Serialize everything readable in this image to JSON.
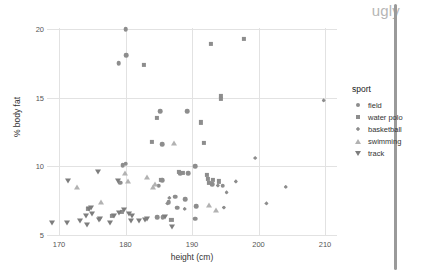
{
  "watermark": "ugly",
  "legend": {
    "title": "sport",
    "entries": [
      {
        "label": "field",
        "marker": "circle-marker-icon"
      },
      {
        "label": "water polo",
        "marker": "square-marker-icon"
      },
      {
        "label": "basketball",
        "marker": "diamond-marker-icon"
      },
      {
        "label": "swimming",
        "marker": "triangle-up-marker-icon"
      },
      {
        "label": "track",
        "marker": "triangle-down-marker-icon"
      }
    ]
  },
  "chart_data": {
    "type": "scatter",
    "title": "",
    "xlabel": "height (cm)",
    "ylabel": "% body fat",
    "xlim": [
      166.5,
      212.5
    ],
    "ylim": [
      4.6,
      20.6
    ],
    "xticks": [
      170,
      180,
      190,
      200,
      210
    ],
    "yticks": [
      5,
      10,
      15,
      20
    ],
    "grid": true,
    "legend_position": "right",
    "legend_title": "sport",
    "series": [
      {
        "name": "field",
        "marker": "circle",
        "color": "#8d8d8d",
        "points": [
          [
            180.0,
            20.0
          ],
          [
            180.1,
            18.1
          ],
          [
            179.0,
            17.5
          ],
          [
            185.2,
            14.0
          ],
          [
            189.3,
            14.0
          ],
          [
            185.5,
            11.6
          ],
          [
            179.6,
            10.1
          ],
          [
            180.0,
            10.2
          ],
          [
            179.2,
            8.8
          ],
          [
            185.0,
            8.6
          ],
          [
            185.5,
            9.0
          ],
          [
            188.2,
            9.5
          ],
          [
            189.4,
            9.5
          ],
          [
            190.5,
            10.0
          ],
          [
            187.5,
            7.8
          ],
          [
            189.0,
            7.6
          ],
          [
            186.5,
            7.4
          ],
          [
            187.8,
            7.0
          ],
          [
            190.6,
            7.1
          ],
          [
            193.0,
            8.7
          ],
          [
            194.6,
            8.6
          ],
          [
            184.8,
            6.3
          ],
          [
            185.6,
            6.3
          ],
          [
            190.5,
            6.2
          ]
        ]
      },
      {
        "name": "water polo",
        "marker": "square",
        "color": "#8d8d8d",
        "points": [
          [
            182.8,
            17.4
          ],
          [
            192.9,
            18.9
          ],
          [
            197.8,
            19.3
          ],
          [
            194.3,
            15.1
          ],
          [
            194.4,
            14.9
          ],
          [
            184.7,
            13.5
          ],
          [
            191.4,
            13.2
          ],
          [
            184.0,
            11.8
          ],
          [
            191.8,
            11.7
          ],
          [
            185.3,
            9.0
          ],
          [
            188.0,
            9.6
          ],
          [
            188.6,
            9.5
          ],
          [
            192.2,
            9.4
          ],
          [
            192.4,
            9.1
          ],
          [
            192.6,
            8.8
          ],
          [
            193.2,
            9.0
          ],
          [
            194.0,
            8.9
          ],
          [
            174.4,
            6.9
          ],
          [
            178.0,
            6.4
          ],
          [
            179.4,
            6.7
          ],
          [
            186.9,
            6.1
          ]
        ]
      },
      {
        "name": "basketball",
        "marker": "diamond",
        "color": "#8d8d8d",
        "points": [
          [
            209.8,
            14.8
          ],
          [
            199.5,
            10.6
          ],
          [
            196.6,
            8.9
          ],
          [
            204.1,
            8.5
          ],
          [
            195.2,
            8.1
          ],
          [
            193.9,
            8.6
          ],
          [
            186.6,
            7.7
          ],
          [
            186.3,
            7.3
          ],
          [
            188.9,
            6.9
          ],
          [
            194.8,
            7.0
          ],
          [
            201.2,
            7.3
          ]
        ]
      },
      {
        "name": "swimming",
        "marker": "triangle",
        "color": "#b2b2b2",
        "points": [
          [
            172.7,
            8.5
          ],
          [
            176.3,
            7.4
          ],
          [
            179.9,
            9.5
          ],
          [
            183.3,
            9.2
          ],
          [
            184.2,
            8.5
          ],
          [
            184.4,
            8.7
          ],
          [
            187.3,
            11.7
          ],
          [
            192.5,
            7.2
          ],
          [
            193.6,
            6.8
          ],
          [
            180.4,
            8.9
          ]
        ]
      },
      {
        "name": "track",
        "marker": "triangle-down",
        "color": "#7d7d7d",
        "points": [
          [
            169.0,
            5.9
          ],
          [
            171.2,
            5.9
          ],
          [
            171.4,
            8.9
          ],
          [
            173.2,
            6.0
          ],
          [
            174.0,
            6.4
          ],
          [
            174.2,
            5.7
          ],
          [
            174.5,
            6.9
          ],
          [
            174.8,
            7.0
          ],
          [
            175.0,
            6.5
          ],
          [
            175.8,
            9.6
          ],
          [
            176.0,
            6.1
          ],
          [
            176.2,
            6.2
          ],
          [
            177.6,
            5.9
          ],
          [
            178.2,
            6.4
          ],
          [
            178.8,
            8.9
          ],
          [
            179.0,
            6.6
          ],
          [
            179.8,
            6.8
          ],
          [
            180.5,
            6.5
          ],
          [
            181.0,
            6.4
          ],
          [
            180.9,
            6.0
          ],
          [
            183.0,
            6.1
          ],
          [
            183.2,
            6.2
          ],
          [
            186.0,
            6.3
          ],
          [
            187.0,
            5.6
          ],
          [
            182.0,
            6.0
          ]
        ]
      }
    ]
  }
}
